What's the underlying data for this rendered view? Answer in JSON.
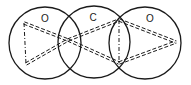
{
  "diagram": {
    "colors": {
      "stroke": "#1a1a1a",
      "background": "#ffffff"
    },
    "atoms": [
      {
        "label": "O",
        "cx": 45,
        "cy": 43,
        "r": 36,
        "label_x": 45,
        "label_y": 22
      },
      {
        "label": "C",
        "cx": 94,
        "cy": 42,
        "r": 36,
        "label_x": 93,
        "label_y": 21
      },
      {
        "label": "O",
        "cx": 145,
        "cy": 43,
        "r": 36,
        "label_x": 150,
        "label_y": 22
      }
    ],
    "triangles": [
      {
        "name": "left-triangle",
        "vertices": [
          [
            24,
            23
          ],
          [
            26,
            64
          ],
          [
            68,
            40
          ]
        ]
      },
      {
        "name": "right-triangle",
        "vertices": [
          [
            119,
            20
          ],
          [
            119,
            63
          ],
          [
            176,
            42
          ]
        ]
      }
    ]
  }
}
